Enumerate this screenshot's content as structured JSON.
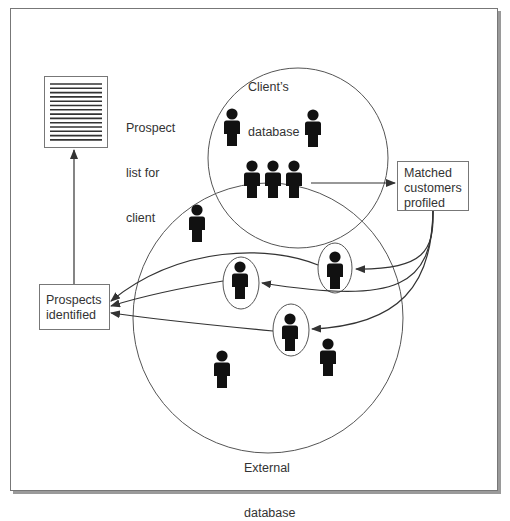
{
  "diagram": {
    "title": "",
    "labels": {
      "client_database": [
        "Client’s",
        "database"
      ],
      "external_database": [
        "External",
        "database"
      ],
      "prospect_list": [
        "Prospect",
        "list for",
        "client"
      ]
    },
    "boxes": {
      "matched_customers": [
        "Matched",
        "customers",
        "profiled"
      ],
      "prospects_identified": [
        "Prospects",
        "identified"
      ]
    },
    "nodes": [
      {
        "id": "prospect-list-document",
        "type": "document",
        "label": "Prospect list for client"
      },
      {
        "id": "client-database",
        "type": "set",
        "label": "Client’s database"
      },
      {
        "id": "external-database",
        "type": "set",
        "label": "External database"
      },
      {
        "id": "matched-customers",
        "type": "box",
        "label": "Matched customers profiled"
      },
      {
        "id": "prospects-identified",
        "type": "box",
        "label": "Prospects identified"
      }
    ],
    "people": {
      "client_only": 2,
      "matched_overlap": 3,
      "external_unmatched": 3,
      "external_identified_prospects": 3
    },
    "edges": [
      {
        "from": "matched_overlap_group",
        "to": "matched-customers"
      },
      {
        "from": "matched-customers",
        "to": "identified-prospect-1"
      },
      {
        "from": "matched-customers",
        "to": "identified-prospect-2"
      },
      {
        "from": "matched-customers",
        "to": "identified-prospect-3"
      },
      {
        "from": "identified-prospect-1",
        "to": "prospects-identified"
      },
      {
        "from": "identified-prospect-2",
        "to": "prospects-identified"
      },
      {
        "from": "identified-prospect-3",
        "to": "prospects-identified"
      },
      {
        "from": "prospects-identified",
        "to": "prospect-list-document"
      }
    ],
    "colors": {
      "line": "#333333",
      "figure": "#111111",
      "frame": "#777777",
      "shadow": "#9a9a9a",
      "text": "#333333"
    }
  }
}
